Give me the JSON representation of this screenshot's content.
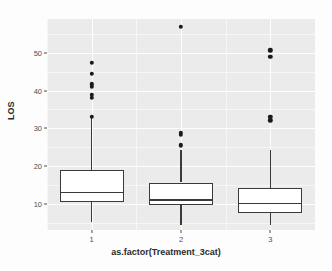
{
  "chart_data": {
    "type": "box",
    "title": "",
    "xlabel": "as.factor(Treatment_3cat)",
    "ylabel": "LOS",
    "categories": [
      "1",
      "2",
      "3"
    ],
    "ylim": [
      3,
      59
    ],
    "yticks": [
      10,
      20,
      30,
      40,
      50
    ],
    "ytick_labels": [
      "10",
      "20",
      "30",
      "40",
      "50"
    ],
    "y_minor_ticks": [
      5,
      15,
      25,
      35,
      45,
      55
    ],
    "grid": true,
    "legend": "none",
    "panel_background": "#ebebeb",
    "grid_color": "#ffffff",
    "box_fill": "#ffffff",
    "line_color": "#3a3a3a",
    "point_color": "#1a1a1a",
    "boxes": [
      {
        "category": "1",
        "lower_whisker": 5.0,
        "q1": 10.5,
        "median": 13.0,
        "q3": 19.0,
        "upper_whisker": 33.0,
        "outliers": [
          33.0,
          38.0,
          38.8,
          41.0,
          41.7,
          44.5,
          47.4
        ]
      },
      {
        "category": "2",
        "lower_whisker": 4.2,
        "q1": 9.6,
        "median": 11.0,
        "q3": 15.6,
        "upper_whisker": 24.2,
        "outliers": [
          25.5,
          28.2,
          28.8,
          57.0
        ]
      },
      {
        "category": "3",
        "lower_whisker": 4.2,
        "q1": 7.6,
        "median": 10.0,
        "q3": 14.2,
        "upper_whisker": 24.2,
        "outliers": [
          32.1,
          33.0,
          48.9,
          50.7
        ]
      }
    ]
  }
}
